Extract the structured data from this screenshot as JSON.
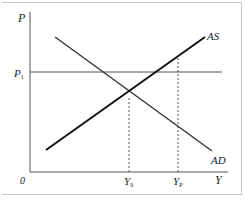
{
  "diagram": {
    "type": "AS-AD model",
    "axes": {
      "y_label": "P",
      "x_label": "Y",
      "origin_label": "0"
    },
    "price_level": {
      "label": "P",
      "subscript": "1"
    },
    "curves": [
      {
        "name": "AS",
        "label": "AS",
        "slope": "upward"
      },
      {
        "name": "AD",
        "label": "AD",
        "slope": "downward"
      }
    ],
    "x_markers": [
      {
        "label": "Y",
        "subscript": "0",
        "meaning": "equilibrium output"
      },
      {
        "label": "Y",
        "subscript": "P",
        "meaning": "potential output"
      }
    ],
    "colors": {
      "curve": "#1a1a1a",
      "axis": "#555555",
      "frame": "#c8c8c8"
    }
  }
}
